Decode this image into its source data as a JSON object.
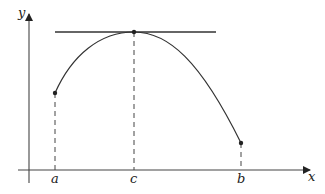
{
  "diagram": {
    "axes": {
      "x_label": "x",
      "y_label": "y"
    },
    "points": [
      {
        "name": "a",
        "label": "a"
      },
      {
        "name": "c",
        "label": "c"
      },
      {
        "name": "b",
        "label": "b"
      }
    ],
    "tangent": "horizontal tangent at (c, f(c))",
    "colors": {
      "stroke": "#333333",
      "background": "#ffffff"
    }
  }
}
